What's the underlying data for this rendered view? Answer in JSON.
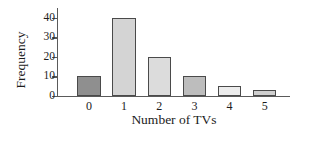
{
  "chart_data": {
    "type": "bar",
    "title": "",
    "xlabel": "Number of TVs",
    "ylabel": "Frequency",
    "categories": [
      "0",
      "1",
      "2",
      "3",
      "4",
      "5"
    ],
    "values": [
      10,
      40,
      20,
      10,
      5,
      3
    ],
    "ylim": [
      0,
      45
    ],
    "yticks": [
      0,
      10,
      20,
      30,
      40
    ],
    "ytick_labels": [
      "0",
      "10",
      "20",
      "30",
      "40"
    ],
    "grid": false,
    "legend": null,
    "bar_colors": [
      "#8f8f8f",
      "#d4d4d4",
      "#dcdcdc",
      "#bdbdbd",
      "#ececec",
      "#cfcfcf"
    ],
    "bar_edge_color": "#4a4a4a",
    "axis_color": "#5a5a5a",
    "text_color": "#1c1c1c"
  }
}
